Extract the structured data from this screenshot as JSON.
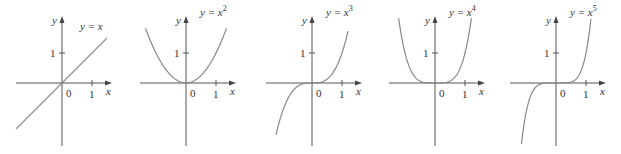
{
  "figure": {
    "unit_px": 30,
    "axis_y_px": 83,
    "panels": [
      {
        "id": "p1",
        "origin_x": 62,
        "label": "y = x",
        "base": "y = x",
        "exp": "",
        "power": 1,
        "xlim": [
          -1.53,
          1.5
        ],
        "ylim": [
          -2.1,
          2.2
        ]
      },
      {
        "id": "p2",
        "origin_x": 186,
        "label": "y = x²",
        "base": "y = x",
        "exp": "2",
        "power": 2,
        "xlim": [
          -1.35,
          1.35
        ],
        "ylim": [
          -2.1,
          2.2
        ]
      },
      {
        "id": "p3",
        "origin_x": 312,
        "label": "y = x³",
        "base": "y = x",
        "exp": "3",
        "power": 3,
        "xlim": [
          -1.2,
          1.2
        ],
        "ylim": [
          -2.1,
          2.2
        ]
      },
      {
        "id": "p4",
        "origin_x": 435,
        "label": "y = x⁴",
        "base": "y = x",
        "exp": "4",
        "power": 4,
        "xlim": [
          -1.25,
          1.25
        ],
        "ylim": [
          -2.1,
          2.2
        ]
      },
      {
        "id": "p5",
        "origin_x": 556,
        "label": "y = x⁵",
        "base": "y = x",
        "exp": "5",
        "power": 5,
        "xlim": [
          -1.2,
          1.2
        ],
        "ylim": [
          -2.1,
          2.2
        ]
      }
    ],
    "axis_labels": {
      "x": "x",
      "y": "y"
    },
    "tick_labels": {
      "origin": "0",
      "x_one": "1",
      "y_one": "1"
    }
  },
  "chart_data": {
    "type": "line",
    "title": "",
    "series": [
      {
        "name": "y = x",
        "function": "x^1"
      },
      {
        "name": "y = x^2",
        "function": "x^2"
      },
      {
        "name": "y = x^3",
        "function": "x^3"
      },
      {
        "name": "y = x^4",
        "function": "x^4"
      },
      {
        "name": "y = x^5",
        "function": "x^5"
      }
    ],
    "xlabel": "x",
    "ylabel": "y",
    "x_ticks": [
      "0",
      "1"
    ],
    "y_ticks": [
      "1"
    ],
    "grid": false
  }
}
